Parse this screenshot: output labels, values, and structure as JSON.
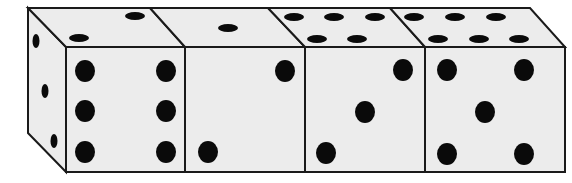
{
  "figure": {
    "colors": {
      "face": "#ececec",
      "outline": "#1a1a1a",
      "pip": "#0a0a0a",
      "background": "#ffffff"
    },
    "dice": [
      {
        "index": 1,
        "front": 6,
        "top": 2,
        "left_side": 3
      },
      {
        "index": 2,
        "front": 2,
        "top": 1
      },
      {
        "index": 3,
        "front": 3,
        "top": 5
      },
      {
        "index": 4,
        "front": 5,
        "top": 6
      }
    ]
  }
}
